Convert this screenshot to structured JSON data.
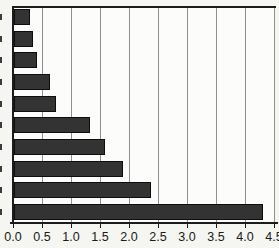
{
  "chart_data": {
    "type": "bar",
    "orientation": "horizontal",
    "title": "",
    "xlabel": "",
    "ylabel": "",
    "categories": [
      "",
      "",
      "",
      "",
      "",
      "",
      "",
      "",
      "",
      ""
    ],
    "values": [
      0.28,
      0.33,
      0.39,
      0.62,
      0.73,
      1.31,
      1.57,
      1.88,
      2.36,
      4.3
    ],
    "xlim": [
      0.0,
      4.5
    ],
    "x_ticks": [
      0.0,
      0.5,
      1.0,
      1.5,
      2.0,
      2.5,
      3.0,
      3.5,
      4.0,
      4.5
    ],
    "x_tick_labels": [
      "0.0",
      "0.5",
      "1.0",
      "1.5",
      "2.0",
      "2.5",
      "3.0",
      "3.5",
      "4.0",
      "4.5"
    ],
    "grid": true,
    "legend": false,
    "y_labels_clipped_at_left_edge": true,
    "colors": {
      "bar_fill": "#333333",
      "bar_border": "#0d0d0d",
      "gridline": "#8f8f8f",
      "axis": "#1c1c1c",
      "tick_label": "#1a1a1a",
      "plot_background": "#fcfcfa",
      "page_background": "#f5f5f2"
    }
  }
}
